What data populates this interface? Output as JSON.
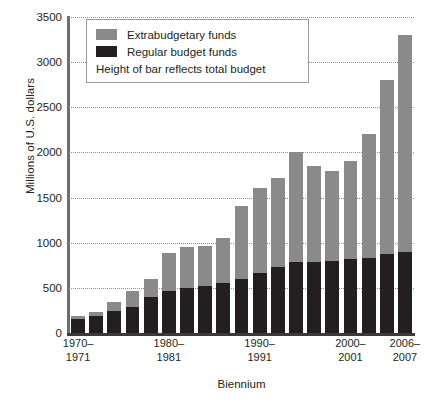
{
  "chart_data": {
    "type": "bar",
    "subtype": "stacked",
    "title": "",
    "xlabel": "Biennium",
    "ylabel": "Millions of U.S. dollars",
    "ylim": [
      0,
      3500
    ],
    "ytick_values": [
      0,
      500,
      1000,
      1500,
      2000,
      2500,
      3000,
      3500
    ],
    "ytick_labels": [
      "0",
      "500",
      "1000",
      "1500",
      "2000",
      "2500",
      "3000",
      "3500"
    ],
    "grid": true,
    "grid_style": "dotted-horizontal",
    "legend_position": "top-left-inside",
    "categories": [
      "1970-1971",
      "1972-1973",
      "1974-1975",
      "1976-1977",
      "1978-1979",
      "1980-1981",
      "1982-1983",
      "1984-1985",
      "1986-1987",
      "1988-1989",
      "1990-1991",
      "1992-1993",
      "1994-1995",
      "1996-1997",
      "1998-1999",
      "2000-2001",
      "2002-2003",
      "2004-2005",
      "2006-2007"
    ],
    "xtick_labeled": [
      {
        "index": 0,
        "line1": "1970–",
        "line2": "1971"
      },
      {
        "index": 5,
        "line1": "1980–",
        "line2": "1981"
      },
      {
        "index": 10,
        "line1": "1990–",
        "line2": "1991"
      },
      {
        "index": 15,
        "line1": "2000–",
        "line2": "2001"
      },
      {
        "index": 18,
        "line1": "2006–",
        "line2": "2007"
      }
    ],
    "series": [
      {
        "name": "Regular budget funds",
        "color": "#231f20",
        "values": [
          150,
          190,
          240,
          290,
          400,
          460,
          500,
          520,
          550,
          600,
          660,
          730,
          790,
          790,
          800,
          820,
          830,
          870,
          900
        ]
      },
      {
        "name": "Extrabudgetary funds",
        "color": "#8a8a8a",
        "values": [
          40,
          40,
          100,
          180,
          200,
          430,
          450,
          440,
          500,
          810,
          950,
          990,
          1220,
          1060,
          990,
          1090,
          1370,
          1930,
          2400
        ]
      }
    ],
    "totals": [
      190,
      230,
      340,
      470,
      600,
      890,
      950,
      960,
      1050,
      1410,
      1610,
      1720,
      2010,
      1850,
      1790,
      1910,
      2200,
      2800,
      3300
    ]
  },
  "legend": {
    "entries": [
      {
        "label": "Extrabudgetary funds",
        "swatch": "gray-swatch"
      },
      {
        "label": "Regular budget funds",
        "swatch": "black-swatch"
      }
    ],
    "note": "Height of bar reflects total budget"
  },
  "colors": {
    "extrabudgetary": "#8a8a8a",
    "regular": "#231f20",
    "grid": "#8d8d8d",
    "axis": "#3a3a3a",
    "background": "#ffffff"
  }
}
